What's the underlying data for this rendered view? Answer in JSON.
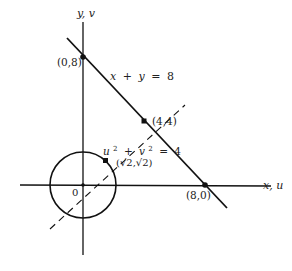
{
  "axes": {
    "vertical_label": "y, v",
    "horizontal_label": "x, u",
    "origin_label": "0"
  },
  "curves": {
    "line_equation": {
      "lhs_x": "x",
      "plus": "+",
      "lhs_y": "y",
      "eq": "=",
      "rhs": "8"
    },
    "circle_equation": {
      "u": "u",
      "u_exp": "2",
      "plus": "+",
      "v": "v",
      "v_exp": "2",
      "eq": "=",
      "rhs": "4"
    }
  },
  "points": [
    {
      "label": "(0,8)"
    },
    {
      "label": "(4,4)"
    },
    {
      "label": "(8,0)"
    },
    {
      "label": "(√2,√2)"
    }
  ],
  "colors": {
    "ink": "#111111",
    "background": "#ffffff"
  }
}
